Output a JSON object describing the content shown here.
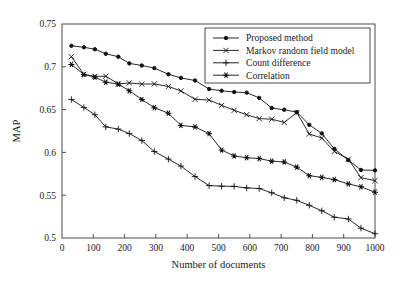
{
  "chart_data": {
    "type": "line",
    "title": "",
    "xlabel": "Number of documents",
    "ylabel": "MAP",
    "xlim": [
      0,
      1000
    ],
    "ylim": [
      0.5,
      0.75
    ],
    "xticks": [
      0,
      100,
      200,
      300,
      400,
      500,
      600,
      700,
      800,
      900,
      1000
    ],
    "xtick_labels": [
      "0",
      "100",
      "200",
      "300",
      "400",
      "500",
      "600",
      "700",
      "800",
      "900",
      "1000"
    ],
    "yticks": [
      0.5,
      0.55,
      0.6,
      0.65,
      0.7,
      0.75
    ],
    "ytick_labels": [
      "0.5",
      "0.55",
      "0.6",
      "0.65",
      "0.7",
      "0.75"
    ],
    "grid": false,
    "legend_position": "top-right",
    "x": [
      30,
      70,
      105,
      140,
      180,
      215,
      255,
      295,
      340,
      380,
      425,
      470,
      510,
      550,
      590,
      630,
      670,
      710,
      750,
      790,
      830,
      870,
      915,
      955,
      1000
    ],
    "series": [
      {
        "name": "Proposed method",
        "marker": "dot",
        "values": [
          0.7245,
          0.7228,
          0.7205,
          0.7152,
          0.7118,
          0.704,
          0.7015,
          0.6985,
          0.6913,
          0.687,
          0.684,
          0.674,
          0.672,
          0.6705,
          0.6698,
          0.6637,
          0.6518,
          0.6498,
          0.647,
          0.6322,
          0.6222,
          0.6042,
          0.591,
          0.5795,
          0.579
        ]
      },
      {
        "name": "Markov random field model",
        "marker": "cross",
        "values": [
          0.7118,
          0.6912,
          0.6888,
          0.689,
          0.68,
          0.6812,
          0.6798,
          0.68,
          0.677,
          0.6718,
          0.662,
          0.6612,
          0.655,
          0.6492,
          0.644,
          0.6395,
          0.6388,
          0.635,
          0.6465,
          0.6215,
          0.6168,
          0.6012,
          0.592,
          0.5705,
          0.567
        ]
      },
      {
        "name": "Count difference",
        "marker": "plus",
        "values": [
          0.6618,
          0.6525,
          0.644,
          0.6298,
          0.6272,
          0.622,
          0.6138,
          0.601,
          0.5922,
          0.584,
          0.5718,
          0.5612,
          0.5605,
          0.5603,
          0.5585,
          0.5578,
          0.5528,
          0.547,
          0.544,
          0.5382,
          0.5318,
          0.5243,
          0.5222,
          0.5115,
          0.505
        ]
      },
      {
        "name": "Correlation",
        "marker": "asterisk",
        "values": [
          0.7028,
          0.691,
          0.688,
          0.682,
          0.6798,
          0.672,
          0.6618,
          0.6522,
          0.6458,
          0.6315,
          0.6298,
          0.6218,
          0.6028,
          0.5958,
          0.5938,
          0.5928,
          0.5898,
          0.5888,
          0.5828,
          0.5728,
          0.5708,
          0.5682,
          0.5632,
          0.5598,
          0.5535
        ]
      }
    ]
  }
}
